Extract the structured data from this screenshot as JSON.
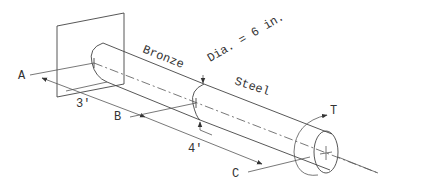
{
  "diagram": {
    "labels": {
      "material_1": "Bronze",
      "material_2": "Steel",
      "diameter": "Dia. = 6 in.",
      "point_a": "A",
      "point_b": "B",
      "point_c": "C",
      "length_1": "3'",
      "length_2": "4'",
      "torque": "T"
    },
    "segments": [
      {
        "name": "Bronze",
        "length": "3'",
        "from": "A",
        "to": "B"
      },
      {
        "name": "Steel",
        "length": "4'",
        "from": "B",
        "to": "C"
      }
    ],
    "colors": {
      "line": "#444444",
      "text": "#333333",
      "background": "#ffffff"
    }
  }
}
